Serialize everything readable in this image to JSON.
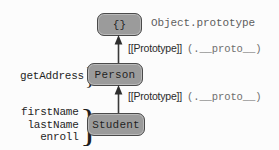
{
  "diagram": {
    "background_color": "#fcfcfc",
    "node_fill_color": "#9b9b9b",
    "node_border_color": "#4a4a4a",
    "text_color": "#1f1f1f",
    "muted_text_color": "#6f6f6f"
  },
  "nodes": [
    {
      "id": "object",
      "label": "{}",
      "caption": "Object.prototype"
    },
    {
      "id": "person",
      "label": "Person",
      "caption": ""
    },
    {
      "id": "student",
      "label": "Student",
      "caption": ""
    }
  ],
  "edges": [
    {
      "id": "student-to-person",
      "from": "Student",
      "to": "Person",
      "tag": "[[Prototype]]",
      "property": "(.__proto__)",
      "direction": "up"
    },
    {
      "id": "person-to-object",
      "from": "Person",
      "to": "Object.prototype",
      "tag": "[[Prototype]]",
      "property": "(.__proto__)",
      "direction": "up"
    }
  ],
  "members": {
    "person": {
      "brace": "}",
      "items": [
        "getAddress"
      ],
      "text": "getAddress"
    },
    "student": {
      "brace": "}",
      "items": [
        "firstName",
        "lastName",
        "enroll"
      ],
      "text": "firstName\nlastName\nenroll"
    }
  }
}
